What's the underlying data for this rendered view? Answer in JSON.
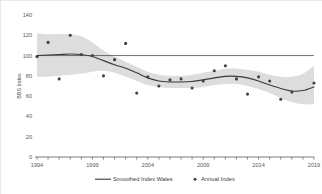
{
  "chart_data": {
    "type": "line",
    "title": "",
    "xlabel": "",
    "ylabel": "BBS Index",
    "xlim": [
      1994,
      2019
    ],
    "ylim": [
      0,
      140
    ],
    "ytick_labels": [
      "0",
      "20",
      "40",
      "60",
      "80",
      "100",
      "120",
      "140"
    ],
    "yticks": [
      0,
      20,
      40,
      60,
      80,
      100,
      120,
      140
    ],
    "xtick_labels": [
      "1994",
      "1999",
      "2004",
      "2009",
      "2014",
      "2019"
    ],
    "xticks": [
      1994,
      1999,
      2004,
      2009,
      2014,
      2019
    ],
    "grid": false,
    "legend_position": "bottom",
    "reference_line": {
      "name": "baseline-100",
      "value": 100,
      "orientation": "horizontal"
    },
    "x": [
      1994,
      1995,
      1996,
      1997,
      1998,
      1999,
      2000,
      2001,
      2002,
      2003,
      2004,
      2005,
      2006,
      2007,
      2008,
      2009,
      2010,
      2011,
      2012,
      2013,
      2014,
      2015,
      2016,
      2017,
      2018,
      2019
    ],
    "series": [
      {
        "name": "Annual Index",
        "type": "scatter",
        "marker": "circle",
        "color": "#404040",
        "values": [
          99,
          113,
          77,
          120,
          101,
          100,
          80,
          96,
          112,
          63,
          79,
          70,
          76,
          77,
          68,
          75,
          85,
          90,
          77,
          62,
          79,
          75,
          57,
          64,
          null,
          73
        ]
      },
      {
        "name": "Smoothed Index Wales",
        "type": "line",
        "color": "#404040",
        "values": [
          100,
          100.5,
          101,
          101.5,
          101,
          99,
          95,
          91,
          87.5,
          83,
          78,
          75,
          74,
          74,
          74.5,
          76,
          78,
          79.5,
          79.5,
          78,
          75,
          71,
          67.5,
          65,
          65.5,
          69
        ]
      },
      {
        "name": "Confidence band upper",
        "type": "band-upper",
        "color": "#d9d9d9",
        "values": [
          122,
          121,
          121,
          121,
          119,
          113,
          105,
          99,
          94,
          89,
          84,
          81,
          80,
          80,
          81,
          83,
          85,
          87,
          87,
          86,
          84,
          81,
          79,
          79,
          82,
          90
        ]
      },
      {
        "name": "Confidence band lower",
        "type": "band-lower",
        "color": "#d9d9d9",
        "values": [
          79,
          79,
          80,
          81,
          82,
          84,
          85,
          83,
          79,
          75,
          71,
          69,
          68,
          68,
          68,
          69,
          71,
          72,
          72,
          70,
          67,
          63,
          58,
          54,
          52,
          52
        ]
      }
    ]
  },
  "legend": {
    "items": [
      {
        "label": "Smoothed Index Wales",
        "marker": "line",
        "color": "#404040"
      },
      {
        "label": "Annual Index",
        "marker": "dot",
        "color": "#404040"
      }
    ]
  },
  "axes": {
    "y_title": "BBS Index"
  }
}
